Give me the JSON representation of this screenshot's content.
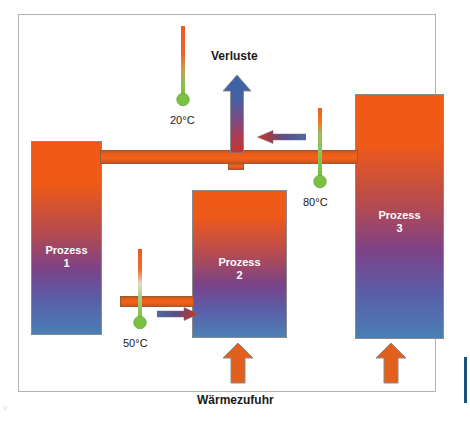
{
  "diagram": {
    "title_alt": "Prozess-Waermekaskade",
    "labels": {
      "verluste": "Verluste",
      "waermezufuhr": "Wärmezufuhr"
    },
    "temperatures": [
      {
        "id": "t20",
        "value": "20°C"
      },
      {
        "id": "t50",
        "value": "50°C"
      },
      {
        "id": "t80",
        "value": "80°C"
      }
    ],
    "processes": [
      {
        "id": "proc1",
        "name": "Prozess",
        "number": "1"
      },
      {
        "id": "proc2",
        "name": "Prozess",
        "number": "2"
      },
      {
        "id": "proc3",
        "name": "Prozess",
        "number": "3"
      }
    ],
    "icons": {
      "thermometer_20": "thermometer-icon",
      "thermometer_50": "thermometer-icon",
      "thermometer_80": "thermometer-icon",
      "loss_arrow": "arrow-up-icon",
      "supply_arrow_2": "arrow-up-icon",
      "supply_arrow_3": "arrow-up-icon",
      "flow_arrow_left": "arrow-right-icon",
      "flow_arrow_right": "arrow-left-icon"
    },
    "colors": {
      "hot_orange": "#f05a14",
      "cold_blue": "#4a7fb5",
      "mid_purple": "#7c4287",
      "pipe_orange": "#ef5c18",
      "supply_arrow_orange": "#e2601e",
      "supply_arrow_stroke": "#8a8a8a",
      "loss_arrow_top_blue": "#3c63a8",
      "loss_arrow_bottom_red": "#c0372e",
      "thermo_bulb_green": "#7ac143",
      "thermo_stem_orange": "#ee5a24",
      "frame_border": "#b3b3b3",
      "text_dark": "#1a1a1a",
      "text_light": "#ffffff",
      "edge_bar_blue": "#1c4f7c"
    },
    "edge_marks": {
      "left_mark": "⁙"
    }
  }
}
